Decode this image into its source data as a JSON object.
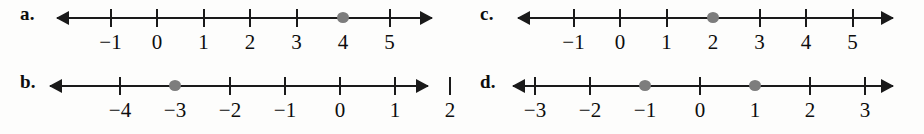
{
  "figure": {
    "background_color": "#fdfdfc",
    "line_color": "#1a1a1a",
    "point_color": "#7d7d7d",
    "text_color": "#0d0d0d"
  },
  "panels": [
    {
      "id": "a",
      "letter": "a.",
      "left": 20,
      "top": 4,
      "axis_left": 57,
      "axis_top": 2,
      "axis_width": 375,
      "unit_px": 46.5,
      "origin_px": 100,
      "ticks": [
        -1,
        0,
        1,
        2,
        3,
        5
      ],
      "labels": [
        {
          "value": -1,
          "text": "−1"
        },
        {
          "value": 0,
          "text": "0"
        },
        {
          "value": 1,
          "text": "1"
        },
        {
          "value": 2,
          "text": "2"
        },
        {
          "value": 3,
          "text": "3"
        },
        {
          "value": 4,
          "text": "4"
        },
        {
          "value": 5,
          "text": "5"
        }
      ],
      "points": [
        4
      ],
      "points_text": "4"
    },
    {
      "id": "b",
      "letter": "b.",
      "left": 20,
      "top": 72,
      "axis_left": 50,
      "axis_top": 2,
      "axis_width": 378,
      "unit_px": 55,
      "origin_px": 290,
      "ticks": [
        -4,
        -2,
        -1,
        0,
        1,
        2
      ],
      "labels": [
        {
          "value": -4,
          "text": "−4"
        },
        {
          "value": -3,
          "text": "−3"
        },
        {
          "value": -2,
          "text": "−2"
        },
        {
          "value": -1,
          "text": "−1"
        },
        {
          "value": 0,
          "text": "0"
        },
        {
          "value": 1,
          "text": "1"
        },
        {
          "value": 2,
          "text": "2"
        }
      ],
      "points": [
        -3
      ],
      "points_text": "−3"
    },
    {
      "id": "c",
      "letter": "c.",
      "left": 480,
      "top": 4,
      "axis_left": 518,
      "axis_top": 2,
      "axis_width": 375,
      "unit_px": 46.5,
      "origin_px": 102,
      "ticks": [
        -1,
        0,
        1,
        3,
        4,
        5
      ],
      "labels": [
        {
          "value": -1,
          "text": "−1"
        },
        {
          "value": 0,
          "text": "0"
        },
        {
          "value": 1,
          "text": "1"
        },
        {
          "value": 2,
          "text": "2"
        },
        {
          "value": 3,
          "text": "3"
        },
        {
          "value": 4,
          "text": "4"
        },
        {
          "value": 5,
          "text": "5"
        }
      ],
      "points": [
        2
      ],
      "points_text": "2"
    },
    {
      "id": "d",
      "letter": "d.",
      "left": 480,
      "top": 72,
      "axis_left": 513,
      "axis_top": 2,
      "axis_width": 380,
      "unit_px": 55,
      "origin_px": 187,
      "ticks": [
        -3,
        -2,
        0,
        2,
        3
      ],
      "labels": [
        {
          "value": -3,
          "text": "−3"
        },
        {
          "value": -2,
          "text": "−2"
        },
        {
          "value": -1,
          "text": "−1"
        },
        {
          "value": 0,
          "text": "0"
        },
        {
          "value": 1,
          "text": "1"
        },
        {
          "value": 2,
          "text": "2"
        },
        {
          "value": 3,
          "text": "3"
        }
      ],
      "points": [
        -1,
        1
      ],
      "points_text": "−1, 1"
    }
  ],
  "chart_data": {
    "type": "number-line",
    "title": "",
    "lines": [
      {
        "label": "a.",
        "xlim": [
          -1.9,
          6.2
        ],
        "tick_labels": [
          "−1",
          "0",
          "1",
          "2",
          "3",
          "4",
          "5"
        ],
        "tick_values": [
          -1,
          0,
          1,
          2,
          3,
          4,
          5
        ],
        "plotted_points": [
          4
        ],
        "arrows": [
          "left",
          "right"
        ]
      },
      {
        "label": "b.",
        "xlim": [
          -4.4,
          2.4
        ],
        "tick_labels": [
          "−4",
          "−3",
          "−2",
          "−1",
          "0",
          "1",
          "2"
        ],
        "tick_values": [
          -4,
          -3,
          -2,
          -1,
          0,
          1,
          2
        ],
        "plotted_points": [
          -3
        ],
        "arrows": [
          "left",
          "right"
        ]
      },
      {
        "label": "c.",
        "xlim": [
          -2.2,
          6.0
        ],
        "tick_labels": [
          "−1",
          "0",
          "1",
          "2",
          "3",
          "4",
          "5"
        ],
        "tick_values": [
          -1,
          0,
          1,
          2,
          3,
          4,
          5
        ],
        "plotted_points": [
          2
        ],
        "arrows": [
          "left",
          "right"
        ]
      },
      {
        "label": "d.",
        "xlim": [
          -3.4,
          3.5
        ],
        "tick_labels": [
          "−3",
          "−2",
          "−1",
          "0",
          "1",
          "2",
          "3"
        ],
        "tick_values": [
          -3,
          -2,
          -1,
          0,
          1,
          2,
          3
        ],
        "plotted_points": [
          -1,
          1
        ],
        "arrows": [
          "left",
          "right"
        ]
      }
    ]
  }
}
